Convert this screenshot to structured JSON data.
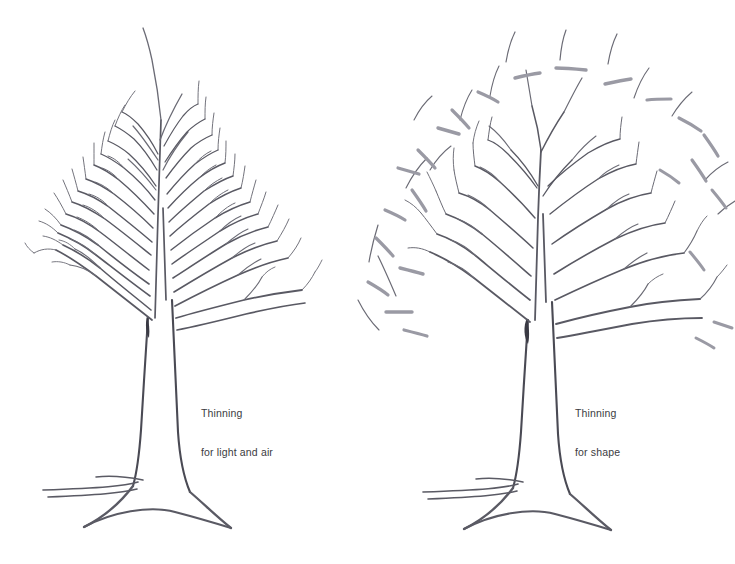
{
  "figure": {
    "background_color": "#ffffff",
    "ink_color": "#595963",
    "cut_mark_color": "#9a9aa4",
    "text_color": "#3b3b41",
    "width": 735,
    "height": 564
  },
  "panels": [
    {
      "id": "left",
      "caption_line1": "Thinning",
      "caption_line2": "for light and air",
      "description": "Dense deciduous tree with many fine branches retained"
    },
    {
      "id": "right",
      "caption_line1": "Thinning",
      "caption_line2": "for shape",
      "description": "Deciduous tree with branches removed, grey dashes mark cut points and detached pieces"
    }
  ]
}
